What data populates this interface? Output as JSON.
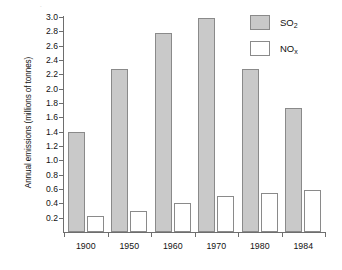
{
  "chart_data": {
    "type": "bar",
    "title": "",
    "xlabel": "",
    "ylabel": "Annual emissions (millions of tonnes)",
    "categories": [
      "1900",
      "1950",
      "1960",
      "1970",
      "1980",
      "1984"
    ],
    "series": [
      {
        "name": "SO2",
        "label": "SO",
        "sub": "2",
        "color": "#c9c9c9",
        "values": [
          1.4,
          2.28,
          2.78,
          2.98,
          2.27,
          1.73
        ]
      },
      {
        "name": "NOx",
        "label": "NO",
        "sub": "x",
        "color": "#ffffff",
        "values": [
          0.22,
          0.3,
          0.41,
          0.5,
          0.54,
          0.58
        ]
      }
    ],
    "ylim": [
      0.0,
      3.0
    ],
    "ytick_labels": [
      "3.0",
      "2.8",
      "2.6",
      "2.4",
      "2.2",
      "2.0",
      "1.8",
      "1.6",
      "1.4",
      "1.2",
      "1.0",
      "0.8",
      "0.6",
      "0.4",
      "0.2"
    ],
    "ytick_values": [
      3.0,
      2.8,
      2.6,
      2.4,
      2.2,
      2.0,
      1.8,
      1.6,
      1.4,
      1.2,
      1.0,
      0.8,
      0.6,
      0.4,
      0.2
    ],
    "grid": false,
    "legend_position": "top-right",
    "axis_color": "#6e6e6e",
    "bar_border_color": "#8a8a8a"
  }
}
